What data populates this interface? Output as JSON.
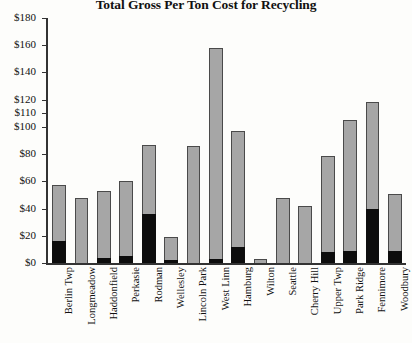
{
  "chart_data": {
    "type": "bar",
    "subtype": "stacked-bar",
    "title": "Total Gross Per Ton Cost for Recycling",
    "xlabel": "",
    "ylabel": "",
    "ylim": [
      0,
      180
    ],
    "grid": false,
    "legend_position": "none",
    "ytick_labels": [
      "$180",
      "$160",
      "$140",
      "$120",
      "$110",
      "$100",
      "$80",
      "$60",
      "$40",
      "$20",
      "$0"
    ],
    "ytick_values": [
      180,
      160,
      140,
      120,
      110,
      100,
      80,
      60,
      40,
      20,
      0
    ],
    "categories": [
      "Berlin Twp",
      "Longmeadow",
      "Haddonfield",
      "Perkasie",
      "Rodman",
      "Wellesley",
      "Lincoln Park",
      "West Linn",
      "Hamburg",
      "Wilton",
      "Seattle",
      "Cherry Hill",
      "Upper Twp",
      "Park Ridge",
      "Fennimore",
      "Woodbury"
    ],
    "series": [
      {
        "name": "lower-segment",
        "color": "#0d0d0d",
        "values": [
          16,
          0,
          4,
          5,
          36,
          2,
          0,
          3,
          12,
          0,
          0,
          0,
          8,
          9,
          40,
          9
        ]
      },
      {
        "name": "upper-segment",
        "color": "#a6a6a6",
        "values": [
          41,
          48,
          49,
          55,
          51,
          17,
          86,
          155,
          85,
          3,
          48,
          42,
          71,
          96,
          78,
          42
        ]
      }
    ],
    "totals": [
      57,
      48,
      53,
      60,
      87,
      19,
      86,
      158,
      97,
      3,
      48,
      42,
      79,
      105,
      118,
      51
    ]
  },
  "colors": {
    "bar_dark": "#0d0d0d",
    "bar_light": "#a6a6a6",
    "axis": "#333333",
    "background": "#fdfdfb"
  }
}
